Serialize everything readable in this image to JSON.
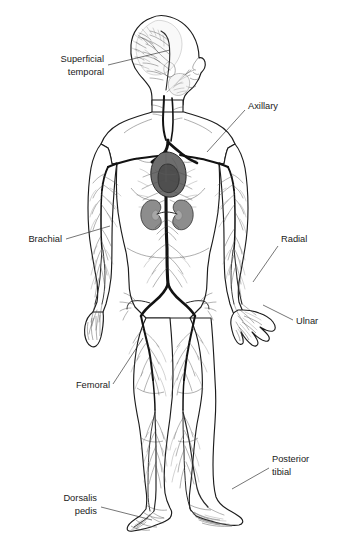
{
  "figure": {
    "view": "anterior full-body with head in right profile",
    "background_color": "#ffffff",
    "line_color": "#1c1c1c",
    "label_color": "#1a1a1a"
  },
  "labels": [
    {
      "id": "superficial-temporal",
      "line1": "Superficial",
      "line2": "temporal",
      "align": "end",
      "text_x": 104,
      "text_y1": 62,
      "text_y2": 75,
      "leader": "M 108 65 L 170 50"
    },
    {
      "id": "axillary",
      "line1": "Axillary",
      "line2": "",
      "align": "start",
      "text_x": 248,
      "text_y1": 106,
      "text_y2": 0,
      "leader": "M 245 110 L 207 152"
    },
    {
      "id": "brachial",
      "line1": "Brachial",
      "line2": "",
      "align": "end",
      "text_x": 62,
      "text_y1": 242,
      "text_y2": 0,
      "leader": "M 66 239 L 110 226"
    },
    {
      "id": "radial",
      "line1": "Radial",
      "line2": "",
      "align": "start",
      "text_x": 281,
      "text_y1": 242,
      "text_y2": 0,
      "leader": "M 278 246 L 253 282"
    },
    {
      "id": "ulnar",
      "line1": "Ulnar",
      "line2": "",
      "align": "start",
      "text_x": 296,
      "text_y1": 324,
      "text_y2": 0,
      "leader": "M 293 320 L 263 305"
    },
    {
      "id": "femoral",
      "line1": "Femoral",
      "line2": "",
      "align": "end",
      "text_x": 110,
      "text_y1": 388,
      "text_y2": 0,
      "leader": "M 113 384 L 143 338"
    },
    {
      "id": "posterior-tibial",
      "line1": "Posterior",
      "line2": "tibial",
      "align": "start",
      "text_x": 272,
      "text_y1": 462,
      "text_y2": 475,
      "leader": "M 269 468 L 232 489"
    },
    {
      "id": "dorsalis-pedis",
      "line1": "Dorsalis",
      "line2": "pedis",
      "align": "end",
      "text_x": 97,
      "text_y1": 501,
      "text_y2": 514,
      "leader": "M 101 507 L 152 520"
    }
  ],
  "anatomy": {
    "organs": [
      {
        "name": "heart",
        "color": "#6d6d6d"
      },
      {
        "name": "left-kidney",
        "color": "#8d8d8d"
      },
      {
        "name": "right-kidney",
        "color": "#8d8d8d"
      }
    ],
    "regions": [
      "head",
      "neck",
      "thorax",
      "abdomen",
      "pelvis",
      "left-arm",
      "right-arm",
      "left-hand",
      "right-hand",
      "left-leg",
      "right-leg",
      "left-foot",
      "right-foot"
    ]
  }
}
